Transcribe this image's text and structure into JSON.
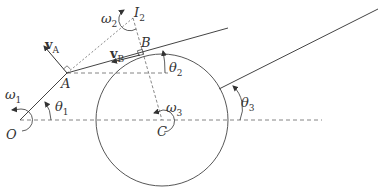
{
  "figure": {
    "type": "kinematic-mechanism-diagram",
    "colors": {
      "line": "#444444",
      "dashed": "#666666",
      "text": "#333333",
      "background": "#ffffff"
    }
  },
  "points": {
    "O": {
      "label": "O",
      "x": 20,
      "y": 120
    },
    "A": {
      "label": "A",
      "x": 67,
      "y": 73
    },
    "B": {
      "label": "B",
      "x": 145,
      "y": 53
    },
    "I2": {
      "label": "I",
      "sub": "2",
      "x": 133,
      "y": 18
    },
    "C": {
      "label": "C",
      "x": 162,
      "y": 120
    }
  },
  "circle": {
    "cx": 162,
    "cy": 120,
    "r": 66
  },
  "angles": {
    "theta1": {
      "label": "θ",
      "sub": "1"
    },
    "theta2": {
      "label": "θ",
      "sub": "2"
    },
    "theta3": {
      "label": "θ",
      "sub": "3"
    }
  },
  "angular_velocities": {
    "omega1": {
      "label": "ω",
      "sub": "1"
    },
    "omega2": {
      "label": "ω",
      "sub": "2"
    },
    "omega3": {
      "label": "ω",
      "sub": "3"
    }
  },
  "velocities": {
    "vA": {
      "label": "v",
      "sub": "A"
    },
    "vB": {
      "label": "v",
      "sub": "B"
    }
  }
}
